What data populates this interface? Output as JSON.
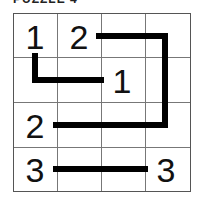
{
  "title": "PUZZLE 4",
  "grid": {
    "rows": 4,
    "cols": 4,
    "cells": [
      {
        "row": 0,
        "col": 0,
        "value": "1"
      },
      {
        "row": 0,
        "col": 1,
        "value": "2"
      },
      {
        "row": 1,
        "col": 2,
        "value": "1"
      },
      {
        "row": 2,
        "col": 0,
        "value": "2"
      },
      {
        "row": 3,
        "col": 0,
        "value": "3"
      },
      {
        "row": 3,
        "col": 3,
        "value": "3"
      }
    ]
  },
  "paths": [
    {
      "name": "path-1",
      "connects": [
        "1",
        "1"
      ]
    },
    {
      "name": "path-2",
      "connects": [
        "2",
        "2"
      ]
    },
    {
      "name": "path-3",
      "connects": [
        "3",
        "3"
      ]
    }
  ],
  "colors": {
    "line": "#000000",
    "grid": "#777777",
    "background": "#ffffff"
  }
}
